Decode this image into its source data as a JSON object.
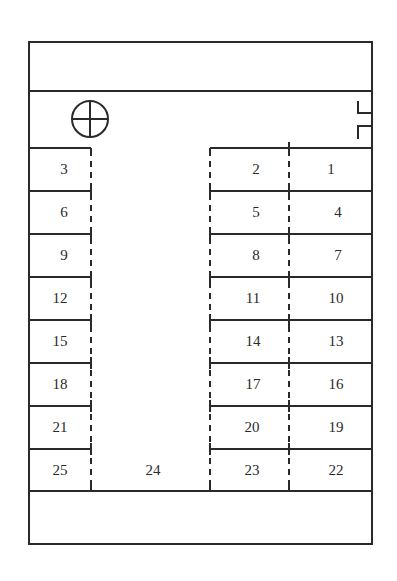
{
  "diagram": {
    "type": "parking-lot-layout",
    "colors": {
      "line": "#2a2a2a",
      "background": "#ffffff"
    },
    "symbols": {
      "compass_or_post": "circle-with-cross-icon",
      "entrance": "gate-icon"
    },
    "stalls": [
      {
        "id": "1",
        "label": "1",
        "x": 331,
        "y": 169
      },
      {
        "id": "2",
        "label": "2",
        "x": 256,
        "y": 169
      },
      {
        "id": "3",
        "label": "3",
        "x": 64,
        "y": 169
      },
      {
        "id": "4",
        "label": "4",
        "x": 338,
        "y": 212
      },
      {
        "id": "5",
        "label": "5",
        "x": 256,
        "y": 212
      },
      {
        "id": "6",
        "label": "6",
        "x": 64,
        "y": 212
      },
      {
        "id": "7",
        "label": "7",
        "x": 338,
        "y": 255
      },
      {
        "id": "8",
        "label": "8",
        "x": 256,
        "y": 255
      },
      {
        "id": "9",
        "label": "9",
        "x": 64,
        "y": 255
      },
      {
        "id": "10",
        "label": "10",
        "x": 336,
        "y": 298
      },
      {
        "id": "11",
        "label": "11",
        "x": 253,
        "y": 298
      },
      {
        "id": "12",
        "label": "12",
        "x": 60,
        "y": 298
      },
      {
        "id": "13",
        "label": "13",
        "x": 336,
        "y": 341
      },
      {
        "id": "14",
        "label": "14",
        "x": 253,
        "y": 341
      },
      {
        "id": "15",
        "label": "15",
        "x": 60,
        "y": 341
      },
      {
        "id": "16",
        "label": "16",
        "x": 336,
        "y": 384
      },
      {
        "id": "17",
        "label": "17",
        "x": 253,
        "y": 384
      },
      {
        "id": "18",
        "label": "18",
        "x": 60,
        "y": 384
      },
      {
        "id": "19",
        "label": "19",
        "x": 336,
        "y": 427
      },
      {
        "id": "20",
        "label": "20",
        "x": 252,
        "y": 427
      },
      {
        "id": "21",
        "label": "21",
        "x": 60,
        "y": 427
      },
      {
        "id": "22",
        "label": "22",
        "x": 336,
        "y": 470
      },
      {
        "id": "23",
        "label": "23",
        "x": 252,
        "y": 470
      },
      {
        "id": "24",
        "label": "24",
        "x": 153,
        "y": 470
      },
      {
        "id": "25",
        "label": "25",
        "x": 60,
        "y": 470
      }
    ]
  }
}
